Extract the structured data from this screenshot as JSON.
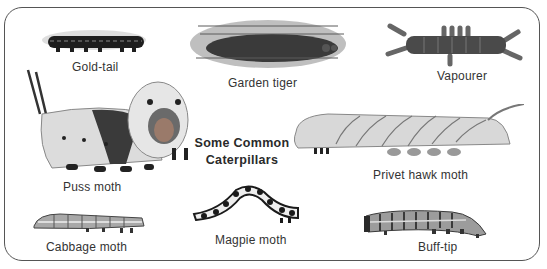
{
  "plate": {
    "title_line1": "Some Common",
    "title_line2": "Caterpillars"
  },
  "caterpillars": [
    {
      "name": "Gold-tail",
      "colors": {
        "body": "#1e1e1e",
        "hair": "#9a9a9a"
      }
    },
    {
      "name": "Garden tiger",
      "colors": {
        "body": "#3a3a3a",
        "hair": "#6e6e6e"
      }
    },
    {
      "name": "Vapourer",
      "colors": {
        "body": "#4a4a4a",
        "tufts": "#6a6a6a"
      }
    },
    {
      "name": "Puss moth",
      "colors": {
        "body": "#dcdcdc",
        "saddle": "#3a3a3a"
      }
    },
    {
      "name": "Privet hawk moth",
      "colors": {
        "body": "#d8d8d8",
        "stripes": "#777777"
      }
    },
    {
      "name": "Cabbage moth",
      "colors": {
        "body": "#a8a8a8"
      }
    },
    {
      "name": "Magpie moth",
      "colors": {
        "body": "#eeeeee",
        "spots": "#1a1a1a"
      }
    },
    {
      "name": "Buff-tip",
      "colors": {
        "body": "#9c9c9c",
        "bands": "#3a3a3a"
      }
    }
  ]
}
